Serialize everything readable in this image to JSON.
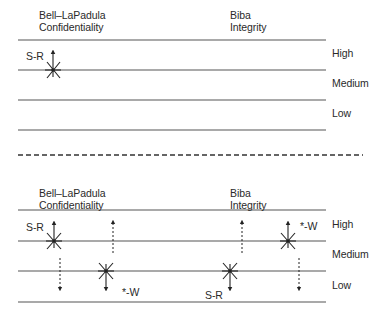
{
  "diagram": {
    "colors": {
      "line": "#555555",
      "text": "#2a2a2a",
      "glyph": "#222222"
    },
    "top_panel": {
      "left_header": {
        "line1": "Bell–LaPadula",
        "line2": "Confidentiality"
      },
      "right_header": {
        "line1": "Biba",
        "line2": "Integrity"
      },
      "levels": [
        "High",
        "Medium",
        "Low"
      ],
      "annotations": [
        {
          "label": "S-R",
          "model": "Bell–LaPadula",
          "level": "Medium",
          "arrow": "up"
        }
      ]
    },
    "separator": "dashed",
    "bottom_panel": {
      "left_header": {
        "line1": "Bell–LaPadula",
        "line2": "Confidentiality"
      },
      "right_header": {
        "line1": "Biba",
        "line2": "Integrity"
      },
      "levels": [
        "High",
        "Medium",
        "Low"
      ],
      "annotations": [
        {
          "label": "S-R",
          "model": "Bell–LaPadula",
          "subject_level": "Medium",
          "allowed": "read down",
          "blocked": "read up"
        },
        {
          "label": "*-W",
          "model": "Bell–LaPadula",
          "subject_level": "Low",
          "allowed": "write up",
          "blocked": "write down"
        },
        {
          "label": "S-R",
          "model": "Biba",
          "subject_level": "Low",
          "allowed": "read up",
          "blocked": "read down"
        },
        {
          "label": "*-W",
          "model": "Biba",
          "subject_level": "Medium",
          "allowed": "write down",
          "blocked": "write up"
        }
      ]
    }
  }
}
